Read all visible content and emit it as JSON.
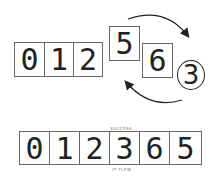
{
  "diagram": {
    "top_row": {
      "fixed_cells": [
        "0",
        "1",
        "2"
      ],
      "raised_cell": "5",
      "cell_after": "6",
      "circled_value": "3"
    },
    "bottom_row": {
      "cells": [
        "0",
        "1",
        "2",
        "3",
        "6",
        "5"
      ],
      "label_above": "SUCCESS",
      "label_below": "IT FLEW"
    },
    "arrows": [
      "swap-arrow-top",
      "swap-arrow-bottom"
    ],
    "colors": {
      "stroke": "#222222",
      "box_border": "#666666"
    }
  }
}
